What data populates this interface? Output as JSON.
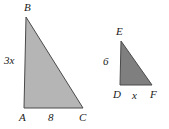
{
  "figure": {
    "background_color": "#ffffff",
    "stroke_color": "#4a4a4a",
    "text_color": "#1a1a1a",
    "triangles": [
      {
        "id": "large-triangle",
        "name": "triangle-ABC",
        "fill_color": "#b5b5b5",
        "vertices": {
          "A": {
            "x": 24,
            "y": 108
          },
          "B": {
            "x": 26,
            "y": 17
          },
          "C": {
            "x": 83,
            "y": 108
          }
        },
        "vertex_labels": {
          "A": "A",
          "B": "B",
          "C": "C"
        },
        "side_labels": {
          "vertical_leg": "3x",
          "horizontal_leg": "8"
        }
      },
      {
        "id": "small-triangle",
        "name": "triangle-DEF",
        "fill_color": "#7f7f7f",
        "vertices": {
          "D": {
            "x": 120,
            "y": 85
          },
          "E": {
            "x": 121,
            "y": 41
          },
          "F": {
            "x": 152,
            "y": 85
          }
        },
        "vertex_labels": {
          "D": "D",
          "E": "E",
          "F": "F"
        },
        "side_labels": {
          "vertical_leg": "6",
          "horizontal_leg": "x"
        }
      }
    ]
  },
  "labels": {
    "B": "B",
    "A": "A",
    "C": "C",
    "three_x": "3x",
    "eight": "8",
    "E": "E",
    "D": "D",
    "F": "F",
    "six": "6",
    "x": "x"
  }
}
